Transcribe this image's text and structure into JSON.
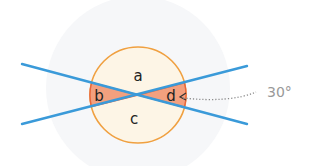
{
  "diagram": {
    "labels": {
      "a": "a",
      "b": "b",
      "c": "c",
      "d": "d"
    },
    "angle_annotation": "30°",
    "colors": {
      "background_disc": "#f6f7f9",
      "circle_fill": "#fdf5e6",
      "circle_stroke": "#f0a040",
      "sector_fill": "#f3a07e",
      "sector_stroke": "#e8643a",
      "line": "#3a9ad9",
      "label_text": "#222222",
      "annotation_text": "#999999",
      "dotted_leader": "#888888"
    }
  }
}
